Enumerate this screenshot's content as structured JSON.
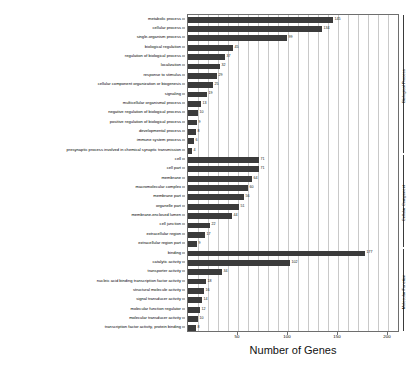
{
  "chart_data": {
    "type": "bar",
    "orientation": "horizontal",
    "title": "",
    "xlabel": "Number of Genes",
    "ylabel": "",
    "xlim": [
      0,
      212
    ],
    "xticks": [
      50,
      100,
      150,
      200
    ],
    "xtick_labels": [
      "50",
      "100",
      "150",
      "200"
    ],
    "gridstep": 10,
    "grid": true,
    "legend": "none",
    "bar_color": "#3b3b3b",
    "categories": [
      "metabolic process",
      "cellular process",
      "single-organism process",
      "biological regulation",
      "regulation of biological process",
      "localization",
      "response to stimulus",
      "cellular component organization or biogenesis",
      "signaling",
      "multicellular organismal process",
      "negative regulation of biological process",
      "positive regulation of biological process",
      "developmental process",
      "immune system process",
      "presynaptic process involved in chemical synaptic transmission",
      "cell",
      "cell part",
      "membrane",
      "macromolecular complex",
      "membrane part",
      "organelle part",
      "membrane-enclosed lumen",
      "cell junction",
      "extracellular region",
      "extracellular region part",
      "binding",
      "catalytic activity",
      "transporter activity",
      "nucleic acid binding transcription factor activity",
      "structural molecule activity",
      "signal transducer activity",
      "molecular function regulator",
      "molecular transducer activity",
      "transcription factor activity, protein binding"
    ],
    "values": [
      145,
      134,
      99,
      45,
      37,
      32,
      29,
      25,
      19,
      13,
      10,
      9,
      8,
      6,
      4,
      71,
      71,
      64,
      60,
      56,
      51,
      44,
      22,
      17,
      9,
      177,
      102,
      34,
      18,
      16,
      14,
      12,
      10,
      8
    ],
    "value_labels": [
      "145",
      "134",
      "99",
      "45",
      "37",
      "32",
      "29",
      "25",
      "19",
      "13",
      "10",
      "9",
      "8",
      "6",
      "4",
      "71",
      "71",
      "64",
      "60",
      "56",
      "51",
      "44",
      "22",
      "17",
      "9",
      "177",
      "102",
      "34",
      "18",
      "16",
      "14",
      "12",
      "10",
      "8"
    ],
    "groups": [
      {
        "label": "Biological Process",
        "start_index": 0,
        "end_index": 14
      },
      {
        "label": "Cellular Component",
        "start_index": 15,
        "end_index": 24
      },
      {
        "label": "Molecular Function",
        "start_index": 25,
        "end_index": 33
      }
    ]
  }
}
